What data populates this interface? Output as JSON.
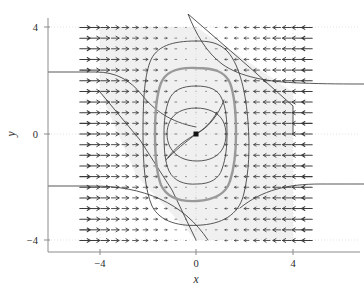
{
  "figure": {
    "type": "phase-portrait",
    "background_color": "#ffffff",
    "region_fill_color": "#f0f0f0",
    "contour_color": "#3a3a3a",
    "highlight_contour_color": "#9a9a9a",
    "arrow_color": "#3a3a3a",
    "axis_color": "#8c8c8c"
  },
  "axes": {
    "xlabel": "x",
    "ylabel": "y",
    "xlim": [
      -5,
      5
    ],
    "ylim": [
      -4.6,
      4.6
    ],
    "xticks": [
      -4,
      0,
      4
    ],
    "xticklabels": [
      "−4",
      "0",
      "4"
    ],
    "yticks": [
      -4,
      0,
      4
    ],
    "yticklabels": [
      "−4",
      "0",
      "4"
    ],
    "grid": true
  },
  "chart_data": {
    "type": "scatter",
    "title": "",
    "xlabel": "x",
    "ylabel": "y",
    "xlim": [
      -5,
      5
    ],
    "ylim": [
      -4.6,
      4.6
    ],
    "xticks": [
      -4,
      0,
      4
    ],
    "yticks": [
      -4,
      0,
      4
    ],
    "grid": true,
    "legend": "none",
    "annotations": [
      {
        "name": "equilibrium-point",
        "x": 0,
        "y": 0,
        "marker": "square",
        "color": "#111111"
      }
    ],
    "series": [
      {
        "name": "vector-field",
        "kind": "quiver",
        "x_range": [
          -4.6,
          4.6
        ],
        "y_range": [
          -4.0,
          4.0
        ],
        "x_count": 23,
        "y_count": 21,
        "description": "Horizontal arrows; pointing right (+x) for x<0 and left (-x) for x>0, magnitude growing with |x|",
        "magnitude_rule": "proportional to |x|"
      },
      {
        "name": "invariant-region",
        "kind": "shaded-polygon",
        "fill": "#f0f0f0",
        "vertices": [
          [
            -4.0,
            4.0
          ],
          [
            0.0,
            4.0
          ],
          [
            4.0,
            1.2
          ],
          [
            4.0,
            -4.0
          ],
          [
            0.0,
            -4.0
          ],
          [
            -2.5,
            -1.3
          ],
          [
            -4.0,
            1.2
          ]
        ]
      },
      {
        "name": "contour-outer",
        "kind": "closed-contour",
        "level": 3.0,
        "style": "thin",
        "extent_x": [
          -1.9,
          1.9
        ],
        "extent_y": [
          -3.2,
          3.5
        ]
      },
      {
        "name": "contour-highlight",
        "kind": "closed-contour",
        "level": 2.0,
        "style": "thick",
        "color": "#9a9a9a",
        "extent_x": [
          -1.6,
          1.6
        ],
        "extent_y": [
          -2.45,
          2.45
        ]
      },
      {
        "name": "contour-middle",
        "kind": "closed-contour",
        "level": 1.2,
        "style": "thin",
        "extent_x": [
          -1.2,
          1.2
        ],
        "extent_y": [
          -1.95,
          1.95
        ]
      },
      {
        "name": "contour-inner",
        "kind": "closed-contour",
        "level": 0.5,
        "style": "thin",
        "extent_x": [
          -1.05,
          1.05
        ],
        "extent_y": [
          -1.1,
          1.1
        ]
      },
      {
        "name": "separatrix-upper-right",
        "kind": "open-curve",
        "style": "thin",
        "description": "enters from top near x=0 and flattens out to the right near y=2"
      },
      {
        "name": "separatrix-lower-left",
        "kind": "open-curve",
        "style": "thin",
        "description": "enters from left near y=-2 and descends diagonally toward bottom near x=0"
      },
      {
        "name": "separatrix-left-upper",
        "kind": "open-curve",
        "style": "thin",
        "description": "enters from left near y=1.2 and bends down toward the core"
      },
      {
        "name": "saddle-crossing-curve",
        "kind": "open-curve",
        "style": "thin",
        "description": "S-shaped curve crossing through the origin"
      }
    ]
  }
}
